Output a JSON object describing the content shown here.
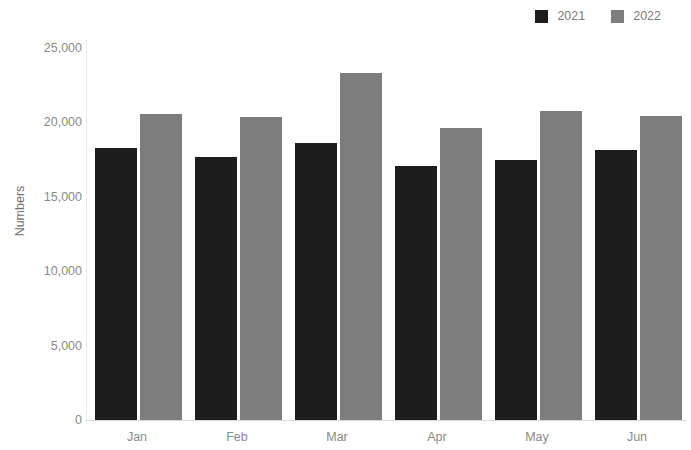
{
  "legend": {
    "position": "top-right",
    "entries": [
      {
        "label": "2021",
        "color": "#1d1d1d",
        "swatch_name": "legend-swatch-2021"
      },
      {
        "label": "2022",
        "color": "#7d7d7d",
        "swatch_name": "legend-swatch-2022"
      }
    ]
  },
  "axes": {
    "ylabel": "Numbers",
    "xlabel": "",
    "yticks": [
      "0",
      "5,000",
      "10,000",
      "15,000",
      "20,000",
      "25,000"
    ],
    "ytick_values": [
      0,
      5000,
      10000,
      15000,
      20000,
      25000
    ],
    "grid": false
  },
  "chart_data": {
    "type": "bar",
    "title": "",
    "subtitle": "",
    "xlabel": "",
    "ylabel": "Numbers",
    "categories": [
      "Jan",
      "Feb",
      "Mar",
      "Apr",
      "May",
      "Jun"
    ],
    "series": [
      {
        "name": "2021",
        "color": "#1d1d1d",
        "values": [
          18300,
          17700,
          18600,
          17100,
          17500,
          18150
        ]
      },
      {
        "name": "2022",
        "color": "#7d7d7d",
        "values": [
          20550,
          20350,
          23300,
          19600,
          20750,
          20400
        ]
      }
    ],
    "ylim": [
      0,
      25000
    ],
    "ytick_labels": [
      "0",
      "5,000",
      "10,000",
      "15,000",
      "20,000",
      "25,000"
    ],
    "legend_position": "top-right",
    "grid": false,
    "annotations": []
  }
}
